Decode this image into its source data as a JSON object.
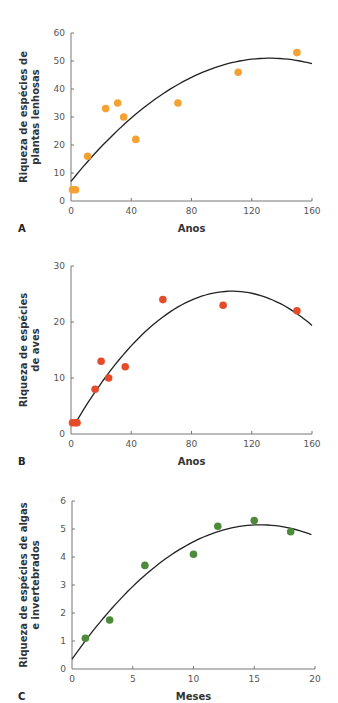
{
  "chart_data": [
    {
      "type": "scatter",
      "panel": "A",
      "title": "",
      "xlabel": "Anos",
      "ylabel": [
        "Riqueza de espécies de",
        "plantas lenhosas"
      ],
      "xlim": [
        0,
        160
      ],
      "ylim": [
        0,
        60
      ],
      "xticks": [
        0,
        40,
        80,
        120,
        160
      ],
      "yticks": [
        0,
        10,
        20,
        30,
        40,
        50,
        60
      ],
      "point_color": "#f4a233",
      "grid": false,
      "points": [
        {
          "x": 1,
          "y": 4
        },
        {
          "x": 3,
          "y": 4
        },
        {
          "x": 11,
          "y": 16
        },
        {
          "x": 23,
          "y": 33
        },
        {
          "x": 31,
          "y": 35
        },
        {
          "x": 35,
          "y": 30
        },
        {
          "x": 43,
          "y": 22
        },
        {
          "x": 71,
          "y": 35
        },
        {
          "x": 111,
          "y": 46
        },
        {
          "x": 150,
          "y": 53
        }
      ],
      "fit_curve": {
        "type": "quadratic",
        "start": [
          0,
          7
        ],
        "peak": [
          132,
          51
        ],
        "end": [
          160,
          49.5
        ]
      },
      "frame": {
        "x0": 71,
        "x1": 312,
        "y0": 201,
        "y1": 33
      }
    },
    {
      "type": "scatter",
      "panel": "B",
      "title": "",
      "xlabel": "Anos",
      "ylabel": [
        "Riqueza de espécies",
        "de aves"
      ],
      "xlim": [
        0,
        160
      ],
      "ylim": [
        0,
        30
      ],
      "xticks": [
        0,
        40,
        80,
        120,
        160
      ],
      "yticks": [
        0,
        10,
        20,
        30
      ],
      "point_color": "#e44b2b",
      "grid": false,
      "points": [
        {
          "x": 1,
          "y": 2
        },
        {
          "x": 3,
          "y": 2
        },
        {
          "x": 4,
          "y": 2
        },
        {
          "x": 16,
          "y": 8
        },
        {
          "x": 20,
          "y": 13
        },
        {
          "x": 25,
          "y": 10
        },
        {
          "x": 36,
          "y": 12
        },
        {
          "x": 61,
          "y": 24
        },
        {
          "x": 101,
          "y": 23
        },
        {
          "x": 150,
          "y": 22
        }
      ],
      "fit_curve": {
        "type": "quadratic",
        "start": [
          3,
          2
        ],
        "peak": [
          107,
          25.5
        ],
        "end": [
          160,
          20
        ]
      },
      "frame": {
        "x0": 71,
        "x1": 312,
        "y0": 434,
        "y1": 266
      }
    },
    {
      "type": "scatter",
      "panel": "C",
      "title": "",
      "xlabel": "Meses",
      "ylabel": [
        "Riqueza de espécies de algas",
        "e invertebrados"
      ],
      "xlim": [
        0,
        20
      ],
      "ylim": [
        0,
        6
      ],
      "xticks": [
        0,
        5,
        10,
        15,
        20
      ],
      "yticks": [
        0,
        1,
        2,
        3,
        4,
        5,
        6
      ],
      "point_color": "#4b8b3b",
      "grid": false,
      "points": [
        {
          "x": 1.1,
          "y": 1.1
        },
        {
          "x": 3.1,
          "y": 1.75
        },
        {
          "x": 6,
          "y": 3.7
        },
        {
          "x": 10,
          "y": 4.1
        },
        {
          "x": 12,
          "y": 5.1
        },
        {
          "x": 15,
          "y": 5.3
        },
        {
          "x": 18,
          "y": 4.9
        }
      ],
      "fit_curve": {
        "type": "quadratic",
        "start": [
          0,
          0.35
        ],
        "peak": [
          15.5,
          5.15
        ],
        "end": [
          19.7,
          4.8
        ]
      },
      "frame": {
        "x0": 72,
        "x1": 315,
        "y0": 669,
        "y1": 501
      }
    }
  ]
}
